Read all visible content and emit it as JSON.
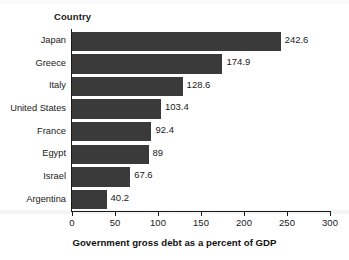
{
  "chart_data": {
    "type": "bar",
    "orientation": "horizontal",
    "title": "",
    "xlabel": "Government gross debt as a percent of GDP",
    "ylabel": "Country",
    "categories": [
      "Japan",
      "Greece",
      "Italy",
      "United States",
      "France",
      "Egypt",
      "Israel",
      "Argentina"
    ],
    "values": [
      242.6,
      174.9,
      128.6,
      103.4,
      92.4,
      89,
      67.6,
      40.2
    ],
    "value_labels": [
      "242.6",
      "174.9",
      "128.6",
      "103.4",
      "92.4",
      "89",
      "67.6",
      "40.2"
    ],
    "xlim": [
      0,
      300
    ],
    "xticks": [
      0,
      50,
      100,
      150,
      200,
      250,
      300
    ],
    "xtick_labels": [
      "0",
      "50",
      "100",
      "150",
      "200",
      "250",
      "300"
    ],
    "grid": false,
    "legend": null,
    "bar_color": "#3a3a3a",
    "text_color": "#1a1a1a",
    "background": "#ffffff"
  }
}
